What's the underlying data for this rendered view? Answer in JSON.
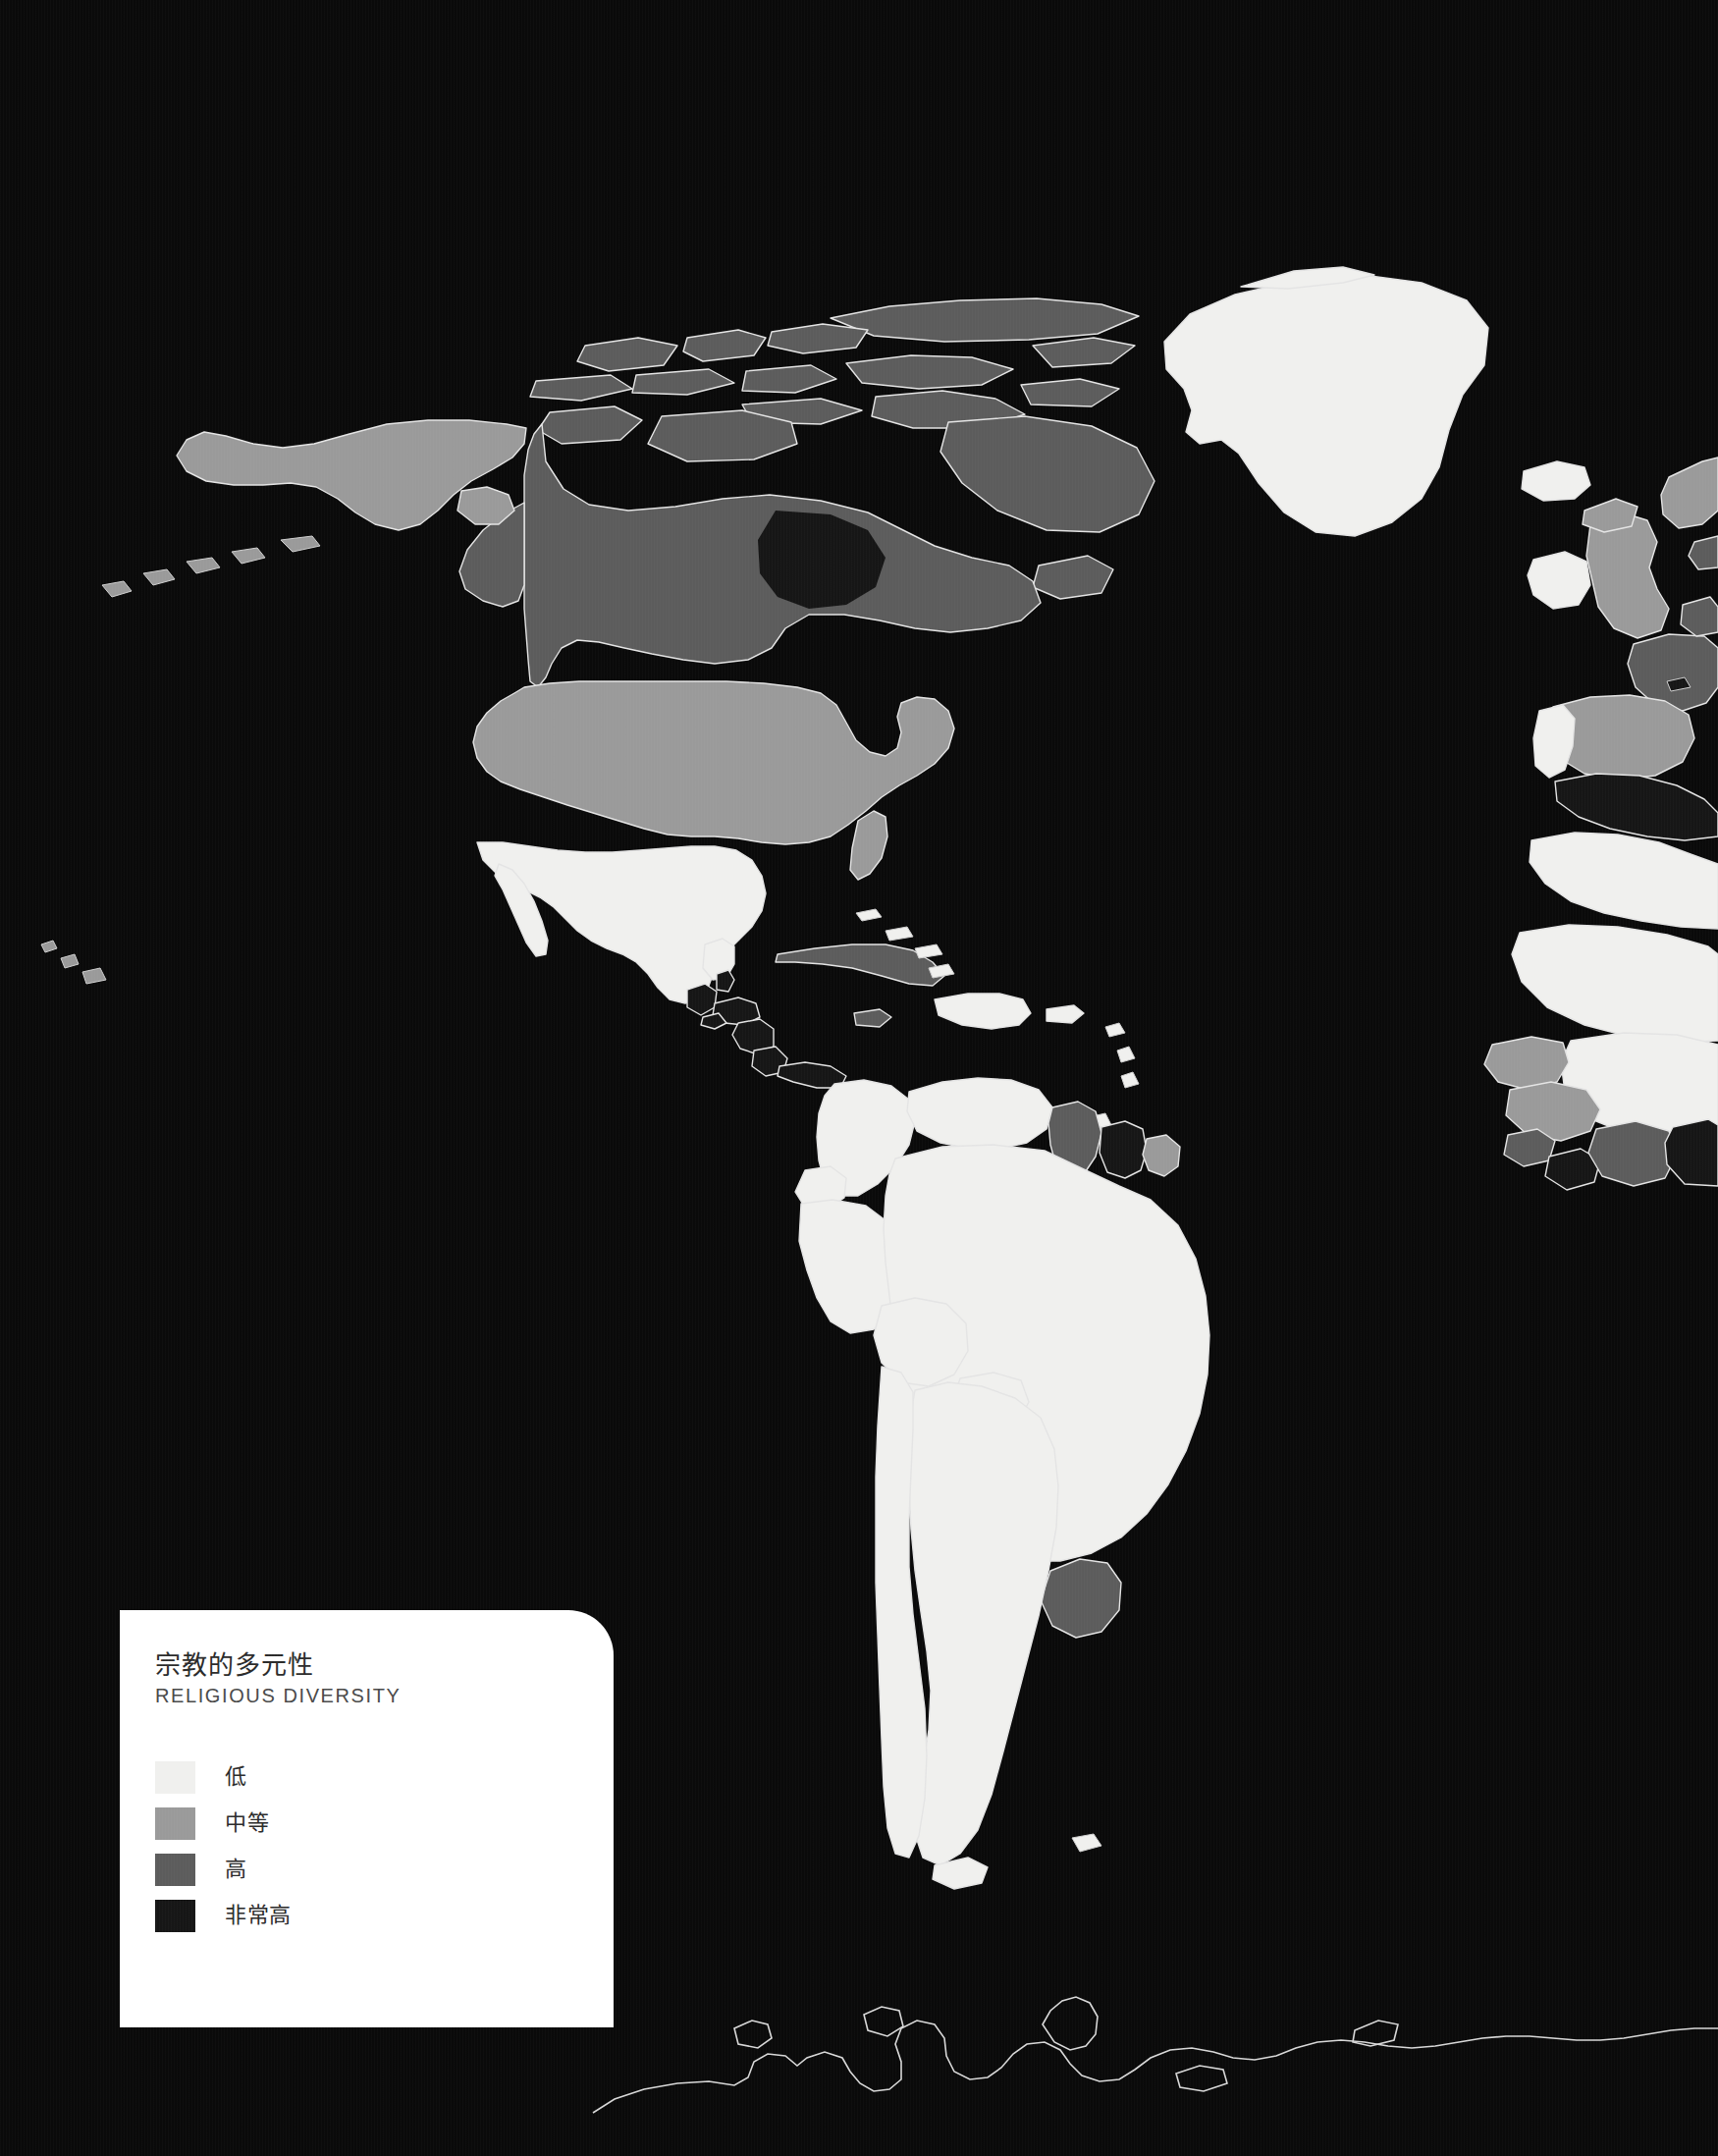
{
  "page": {
    "background_color": "#0a0a0a",
    "width": 1750,
    "height": 2196
  },
  "legend": {
    "title_cjk": "宗教的多元性",
    "title_en": "RELIGIOUS DIVERSITY",
    "background_color": "#ffffff",
    "items": [
      {
        "label": "低",
        "color": "#f0f0ee",
        "level": "low"
      },
      {
        "label": "中等",
        "color": "#9a9a9a",
        "level": "medium"
      },
      {
        "label": "高",
        "color": "#5c5c5c",
        "level": "high"
      },
      {
        "label": "非常高",
        "color": "#161616",
        "level": "very-high"
      }
    ]
  },
  "map": {
    "projection": "equirectangular-cropped",
    "ocean_color": "#0a0a0a",
    "border_stroke": "#e8e8e8",
    "palette": {
      "low": "#f0f0ee",
      "medium": "#9a9a9a",
      "high": "#5c5c5c",
      "very_high": "#161616",
      "no_data": "#0d0d0d"
    },
    "regions": [
      {
        "name": "Greenland",
        "level": "low"
      },
      {
        "name": "Canada",
        "level": "high"
      },
      {
        "name": "Canadian Arctic Islands",
        "level": "high"
      },
      {
        "name": "Alaska",
        "level": "medium"
      },
      {
        "name": "United States",
        "level": "medium"
      },
      {
        "name": "Hawaii",
        "level": "medium"
      },
      {
        "name": "Mexico",
        "level": "low"
      },
      {
        "name": "Guatemala",
        "level": "very-high"
      },
      {
        "name": "Belize",
        "level": "very-high"
      },
      {
        "name": "Honduras",
        "level": "very-high"
      },
      {
        "name": "Nicaragua",
        "level": "very-high"
      },
      {
        "name": "Costa Rica",
        "level": "very-high"
      },
      {
        "name": "Panama",
        "level": "very-high"
      },
      {
        "name": "Cuba",
        "level": "high"
      },
      {
        "name": "Jamaica",
        "level": "high"
      },
      {
        "name": "Haiti",
        "level": "low"
      },
      {
        "name": "Dominican Republic",
        "level": "low"
      },
      {
        "name": "Puerto Rico",
        "level": "low"
      },
      {
        "name": "Bahamas",
        "level": "low"
      },
      {
        "name": "Colombia",
        "level": "low"
      },
      {
        "name": "Venezuela",
        "level": "low"
      },
      {
        "name": "Guyana",
        "level": "high"
      },
      {
        "name": "Suriname",
        "level": "very-high"
      },
      {
        "name": "French Guiana",
        "level": "medium"
      },
      {
        "name": "Ecuador",
        "level": "low"
      },
      {
        "name": "Peru",
        "level": "low"
      },
      {
        "name": "Bolivia",
        "level": "low"
      },
      {
        "name": "Brazil",
        "level": "low"
      },
      {
        "name": "Paraguay",
        "level": "low"
      },
      {
        "name": "Uruguay",
        "level": "high"
      },
      {
        "name": "Argentina",
        "level": "low"
      },
      {
        "name": "Chile",
        "level": "low"
      },
      {
        "name": "Iceland",
        "level": "low"
      },
      {
        "name": "Ireland",
        "level": "low"
      },
      {
        "name": "United Kingdom",
        "level": "medium"
      },
      {
        "name": "France",
        "level": "high"
      },
      {
        "name": "Spain",
        "level": "medium"
      },
      {
        "name": "Portugal",
        "level": "low"
      },
      {
        "name": "Norway",
        "level": "medium"
      },
      {
        "name": "Morocco",
        "level": "very-high"
      },
      {
        "name": "Western Sahara",
        "level": "low"
      },
      {
        "name": "Mauritania",
        "level": "low"
      },
      {
        "name": "Mali",
        "level": "low"
      },
      {
        "name": "Senegal",
        "level": "medium"
      },
      {
        "name": "Guinea",
        "level": "medium"
      },
      {
        "name": "Sierra Leone",
        "level": "high"
      },
      {
        "name": "Liberia",
        "level": "very-high"
      },
      {
        "name": "Ivory Coast",
        "level": "high"
      },
      {
        "name": "Ghana",
        "level": "very-high"
      },
      {
        "name": "Antarctica",
        "level": "no-data"
      }
    ]
  }
}
